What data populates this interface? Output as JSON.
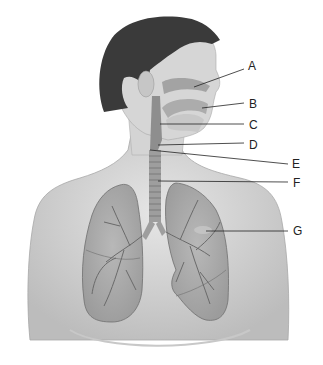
{
  "diagram": {
    "labels": [
      {
        "letter": "A",
        "x": 248,
        "y": 60
      },
      {
        "letter": "B",
        "x": 249,
        "y": 98
      },
      {
        "letter": "C",
        "x": 249,
        "y": 119
      },
      {
        "letter": "D",
        "x": 249,
        "y": 139
      },
      {
        "letter": "E",
        "x": 292,
        "y": 158
      },
      {
        "letter": "F",
        "x": 293,
        "y": 177
      },
      {
        "letter": "G",
        "x": 293,
        "y": 225
      }
    ],
    "colors": {
      "skin": "#d9d9d9",
      "skin_shadow": "#bdbdbd",
      "hair": "#3a3a3a",
      "airway": "#9a9a9a",
      "lung": "#a9a9a9",
      "line": "#222222"
    }
  }
}
